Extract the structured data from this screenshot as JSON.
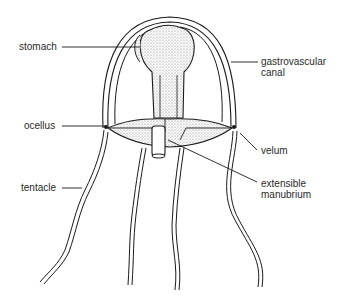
{
  "diagram": {
    "labels": {
      "stomach": "stomach",
      "gastrovascular_line1": "gastrovascular",
      "gastrovascular_line2": "canal",
      "ocellus": "ocellus",
      "velum": "velum",
      "tentacle": "tentacle",
      "manubrium_line1": "extensible",
      "manubrium_line2": "manubrium"
    },
    "colors": {
      "ink": "#1a1a1a",
      "stipple": "#9a9a9a",
      "background": "#ffffff"
    }
  }
}
